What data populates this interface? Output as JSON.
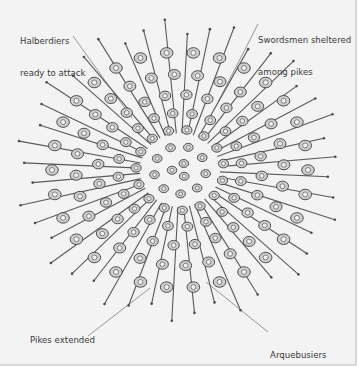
{
  "diagram": {
    "background_color": "#f3f3f3",
    "ink_color": "#3a3a3a",
    "labels": [
      {
        "id": "halberdiers",
        "lines": [
          "Halberdiers",
          "ready to attack"
        ]
      },
      {
        "id": "swordsmen",
        "lines": [
          "Swordsmen sheltered",
          "among pikes"
        ]
      },
      {
        "id": "pikes",
        "lines": [
          "Pikes extended",
          "in all directions"
        ]
      },
      {
        "id": "arquebusiers",
        "lines": [
          "Arquebusiers",
          "in third row"
        ]
      }
    ]
  }
}
